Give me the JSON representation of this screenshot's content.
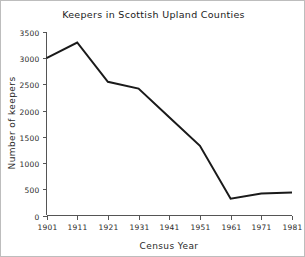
{
  "chart_data": {
    "type": "line",
    "title": "Keepers in Scottish Upland Counties",
    "xlabel": "Census Year",
    "ylabel": "Number of keepers",
    "x": [
      1901,
      1911,
      1921,
      1931,
      1941,
      1951,
      1961,
      1971,
      1981
    ],
    "values": [
      3000,
      3300,
      2550,
      2420,
      1875,
      1330,
      320,
      420,
      440
    ],
    "series": [
      {
        "name": "Number of keepers",
        "values": [
          3000,
          3300,
          2550,
          2420,
          1875,
          1330,
          320,
          420,
          440
        ]
      }
    ],
    "xlim": [
      1901,
      1981
    ],
    "ylim": [
      0,
      3500
    ],
    "xticks": [
      1901,
      1911,
      1921,
      1931,
      1941,
      1951,
      1961,
      1971,
      1981
    ],
    "xtick_labels": [
      "1901",
      "1911",
      "1921",
      "1931",
      "1941",
      "1951",
      "1961",
      "1971",
      "1981"
    ],
    "yticks": [
      0,
      500,
      1000,
      1500,
      2000,
      2500,
      3000,
      3500
    ],
    "ytick_labels": [
      "0",
      "500",
      "1000",
      "1500",
      "2000",
      "2500",
      "3000",
      "3500"
    ],
    "grid": false,
    "legend": false,
    "legend_position": "none",
    "line_color": "#1a1a1a",
    "axis_color": "#555555",
    "background_color": "#ffffff"
  }
}
